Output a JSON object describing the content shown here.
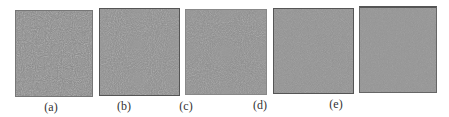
{
  "figure": {
    "panels": [
      {
        "id": "a",
        "tone": "#8c8c8c",
        "contrast": 1.0
      },
      {
        "id": "b",
        "tone": "#8e8e8e",
        "contrast": 0.9
      },
      {
        "id": "c",
        "tone": "#8f8f8f",
        "contrast": 0.85
      },
      {
        "id": "d",
        "tone": "#939393",
        "contrast": 0.6
      },
      {
        "id": "e",
        "tone": "#959595",
        "contrast": 0.45
      }
    ],
    "labels": [
      "(a)",
      "(b)",
      "(c)",
      "(d)",
      "(e)"
    ]
  }
}
